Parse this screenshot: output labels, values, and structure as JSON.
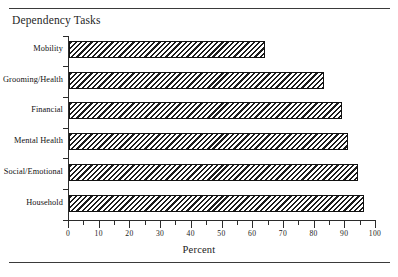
{
  "figure": {
    "title": "Dependency Tasks",
    "rules": {
      "top": true,
      "bottom": true
    }
  },
  "chart_data": {
    "type": "bar",
    "orientation": "horizontal",
    "title": "Dependency Tasks",
    "xlabel": "Percent",
    "ylabel": "",
    "categories": [
      "Mobility",
      "Grooming/Health",
      "Financial",
      "Mental Health",
      "Social/Emotional",
      "Household"
    ],
    "values": [
      64,
      83,
      89,
      91,
      94,
      96
    ],
    "xlim": [
      0,
      100
    ],
    "xticks": [
      0,
      10,
      20,
      30,
      40,
      50,
      60,
      70,
      80,
      90,
      100
    ],
    "xtick_labels": [
      "0",
      "10",
      "20",
      "30",
      "40",
      "50",
      "60",
      "70",
      "80",
      "90",
      "100"
    ],
    "minor_xticks": [
      5,
      15,
      25,
      35,
      45,
      55,
      65,
      75,
      85,
      95
    ],
    "grid": false,
    "legend": null,
    "bar_style": {
      "fill": "diagonal-hatch",
      "hatch_color": "#1c1c1c",
      "background": "#ffffff",
      "edge_color": "#111111"
    }
  }
}
